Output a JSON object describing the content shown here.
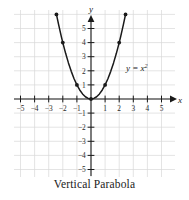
{
  "caption": "Vertical Parabola",
  "colors": {
    "grid": "#d9d9d9",
    "axis": "#1a1a1a",
    "curve": "#1a1a1a",
    "point": "#1a1a1a",
    "text": "#1a1a1a",
    "background": "#ffffff"
  },
  "axes": {
    "x_name": "x",
    "y_name": "y"
  },
  "equation_label": {
    "base": "y = x",
    "exponent": "2"
  },
  "chart_data": {
    "type": "line",
    "title": "Vertical Parabola",
    "subtitle": "",
    "xlabel": "x",
    "ylabel": "y",
    "equation": "y = x^2",
    "xlim": [
      -5.6,
      6.0
    ],
    "ylim": [
      -5.8,
      6.4
    ],
    "grid": true,
    "grid_spacing": 1,
    "legend": "none",
    "annotations": [
      {
        "text": "y = x^2",
        "x": 3.0,
        "y": 2.6
      }
    ],
    "xticks": [
      -5,
      -4,
      -3,
      -2,
      -1,
      1,
      2,
      3,
      4,
      5
    ],
    "xtick_labels": [
      "−5",
      "−4",
      "−3",
      "−2",
      "−1",
      "1",
      "2",
      "3",
      "4",
      "5"
    ],
    "yticks": [
      5,
      4,
      3,
      2,
      1,
      -1,
      -2,
      -3,
      -4,
      -5
    ],
    "ytick_labels": [
      "5",
      "4",
      "3",
      "2",
      "1",
      "−1",
      "−2",
      "−3",
      "−4",
      "−5"
    ],
    "series": [
      {
        "name": "y = x^2",
        "x": [
          -2.45,
          -2.3,
          -2.1,
          -2.0,
          -1.8,
          -1.6,
          -1.4,
          -1.2,
          -1.0,
          -0.8,
          -0.6,
          -0.4,
          -0.2,
          0.0,
          0.2,
          0.4,
          0.6,
          0.8,
          1.0,
          1.2,
          1.4,
          1.6,
          1.8,
          2.0,
          2.1,
          2.3,
          2.45
        ],
        "y": [
          6.0,
          5.29,
          4.41,
          4.0,
          3.24,
          2.56,
          1.96,
          1.44,
          1.0,
          0.64,
          0.36,
          0.16,
          0.04,
          0.0,
          0.04,
          0.16,
          0.36,
          0.64,
          1.0,
          1.44,
          1.96,
          2.56,
          3.24,
          4.0,
          4.41,
          5.29,
          6.0
        ]
      }
    ],
    "marked_points": [
      {
        "x": -2.45,
        "y": 6.0
      },
      {
        "x": -2.0,
        "y": 4.0
      },
      {
        "x": -1.0,
        "y": 1.0
      },
      {
        "x": 0.0,
        "y": 0.0
      },
      {
        "x": 1.0,
        "y": 1.0
      },
      {
        "x": 2.0,
        "y": 4.0
      },
      {
        "x": 2.45,
        "y": 6.0
      }
    ]
  }
}
